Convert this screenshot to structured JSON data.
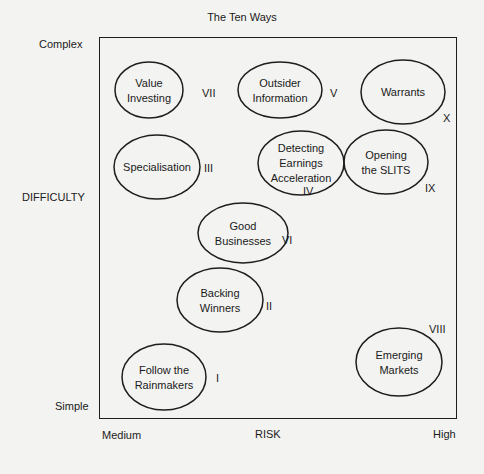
{
  "title": "The Ten Ways",
  "axes": {
    "y_label": "DIFFICULTY",
    "y_top": "Complex",
    "y_bottom": "Simple",
    "x_label": "RISK",
    "x_left": "Medium",
    "x_right": "High"
  },
  "colors": {
    "background": "#f3f3f1",
    "ink": "#1a1a1a"
  },
  "ways": [
    {
      "numeral": "I",
      "lines": [
        "Follow the",
        "Rainmakers"
      ],
      "cx": 164,
      "cy": 377,
      "rx": 42,
      "ry": 33,
      "nx": 216,
      "ny": 382
    },
    {
      "numeral": "II",
      "lines": [
        "Backing",
        "Winners"
      ],
      "cx": 220,
      "cy": 300,
      "rx": 43,
      "ry": 32,
      "nx": 266,
      "ny": 310
    },
    {
      "numeral": "III",
      "lines": [
        "Specialisation"
      ],
      "cx": 157,
      "cy": 167,
      "rx": 43,
      "ry": 32,
      "nx": 204,
      "ny": 172
    },
    {
      "numeral": "IV",
      "lines": [
        "Detecting",
        "Earnings",
        "Acceleration"
      ],
      "cx": 301,
      "cy": 163,
      "rx": 43,
      "ry": 32,
      "nx": 303,
      "ny": 195
    },
    {
      "numeral": "V",
      "lines": [
        "Outsider",
        "Information"
      ],
      "cx": 280,
      "cy": 90,
      "rx": 42,
      "ry": 28,
      "nx": 330,
      "ny": 97
    },
    {
      "numeral": "VI",
      "lines": [
        "Good",
        "Businesses"
      ],
      "cx": 243,
      "cy": 233,
      "rx": 45,
      "ry": 30,
      "nx": 282,
      "ny": 244
    },
    {
      "numeral": "VII",
      "lines": [
        "Value",
        "Investing"
      ],
      "cx": 149,
      "cy": 90,
      "rx": 34,
      "ry": 28,
      "nx": 202,
      "ny": 97
    },
    {
      "numeral": "VIII",
      "lines": [
        "Emerging",
        "Markets"
      ],
      "cx": 399,
      "cy": 362,
      "rx": 43,
      "ry": 34,
      "nx": 429,
      "ny": 333
    },
    {
      "numeral": "IX",
      "lines": [
        "Opening",
        "the SLITS"
      ],
      "cx": 386,
      "cy": 162,
      "rx": 42,
      "ry": 32,
      "nx": 425,
      "ny": 192
    },
    {
      "numeral": "X",
      "lines": [
        "Warrants"
      ],
      "cx": 403,
      "cy": 92,
      "rx": 42,
      "ry": 32,
      "nx": 443,
      "ny": 122
    }
  ]
}
